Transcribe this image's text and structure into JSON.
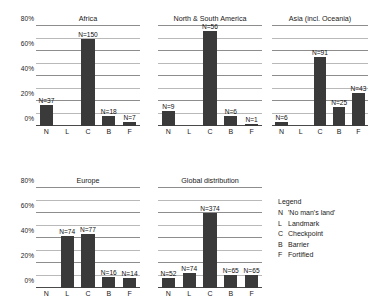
{
  "chart_data": {
    "type": "bar",
    "title": "",
    "categories": [
      "N",
      "L",
      "C",
      "B",
      "F"
    ],
    "ylabel": "",
    "xlabel": "",
    "ylim": [
      0,
      80
    ],
    "ytick_labels": [
      "0%",
      "20%",
      "40%",
      "60%",
      "80%"
    ],
    "ytick_values": [
      0,
      20,
      40,
      60,
      80
    ],
    "minor_gridlines": [
      10,
      30,
      50,
      70
    ],
    "grid": true,
    "legend_position": "right-bottom",
    "panels": [
      {
        "title": "Africa",
        "categories": [
          "N",
          "L",
          "C",
          "B",
          "F"
        ],
        "values": [
          17.2,
          0,
          69.8,
          8.4,
          3.3
        ],
        "data_labels": [
          "N=37",
          "",
          "N=150",
          "N=18",
          "N=7"
        ],
        "counts": [
          37,
          0,
          150,
          18,
          7
        ]
      },
      {
        "title": "North & South America",
        "categories": [
          "N",
          "L",
          "C",
          "B",
          "F"
        ],
        "values": [
          12.2,
          0,
          75.7,
          8.1,
          1.4
        ],
        "data_labels": [
          "N=9",
          "",
          "N=56",
          "N=6",
          "N=1"
        ],
        "counts": [
          9,
          0,
          56,
          6,
          1
        ]
      },
      {
        "title": "Asia (incl. Oceania)",
        "categories": [
          "N",
          "L",
          "C",
          "B",
          "F"
        ],
        "values": [
          3.6,
          0,
          55.2,
          15.2,
          26.1
        ],
        "data_labels": [
          "N=6",
          "",
          "N=91",
          "N=25",
          "N=43"
        ],
        "counts": [
          6,
          0,
          91,
          25,
          43
        ]
      },
      {
        "title": "Europe",
        "categories": [
          "N",
          "L",
          "C",
          "B",
          "F"
        ],
        "values": [
          0,
          41.3,
          43.0,
          8.9,
          7.8
        ],
        "data_labels": [
          "",
          "N=74",
          "N=77",
          "N=16",
          "N=14"
        ],
        "counts": [
          0,
          74,
          77,
          16,
          14
        ]
      },
      {
        "title": "Global distribution",
        "categories": [
          "N",
          "L",
          "C",
          "B",
          "F"
        ],
        "values": [
          8.4,
          11.9,
          60.2,
          10.5,
          10.5
        ],
        "data_labels": [
          "N=52",
          "N=74",
          "N=374",
          "N=65",
          "N=65"
        ],
        "counts": [
          52,
          74,
          374,
          65,
          65
        ]
      }
    ]
  },
  "legend": {
    "title": "Legend",
    "items": [
      {
        "key": "N",
        "desc": "'No man's land'"
      },
      {
        "key": "L",
        "desc": "Landmark"
      },
      {
        "key": "C",
        "desc": "Checkpoint"
      },
      {
        "key": "B",
        "desc": "Barrier"
      },
      {
        "key": "F",
        "desc": "Fortified"
      }
    ]
  }
}
